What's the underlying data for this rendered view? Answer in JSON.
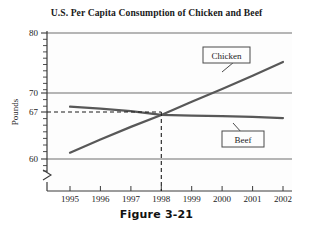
{
  "figure": {
    "caption": "Figure 3-21"
  },
  "chart_data": {
    "type": "line",
    "title": "U.S. Per Capita Consumption of Chicken and Beef",
    "xlabel": "",
    "ylabel": "Pounds",
    "x": [
      1995,
      1996,
      1997,
      1998,
      1999,
      2000,
      2001,
      2002
    ],
    "xtick_labels": [
      "1995",
      "1996",
      "1997",
      "1998",
      "1999",
      "2000",
      "2001",
      "2002"
    ],
    "xlim": [
      1995,
      2002
    ],
    "ylim": [
      60,
      80
    ],
    "ytick_labels": [
      "80",
      "70",
      "67",
      "60"
    ],
    "ytick_values": [
      80,
      70,
      67,
      60
    ],
    "y_minor_tick_step": 1,
    "y_axis_break": true,
    "grid": "horizontal",
    "legend": "callout-boxes",
    "series": [
      {
        "name": "Chicken",
        "color": "#585858",
        "values": [
          61.0,
          63.1,
          65.1,
          67.0,
          69.1,
          71.1,
          73.2,
          75.4
        ]
      },
      {
        "name": "Beef",
        "color": "#585858",
        "values": [
          68.3,
          68.0,
          67.6,
          67.0,
          66.9,
          66.8,
          66.7,
          66.5
        ]
      }
    ],
    "annotations": [
      {
        "name": "intersection",
        "x": 1998,
        "y": 67,
        "guide_style": "dashed",
        "guides": [
          "horizontal",
          "vertical"
        ]
      }
    ],
    "callouts": [
      {
        "name": "chicken-callout",
        "label": "Chicken"
      },
      {
        "name": "beef-callout",
        "label": "Beef"
      }
    ]
  }
}
